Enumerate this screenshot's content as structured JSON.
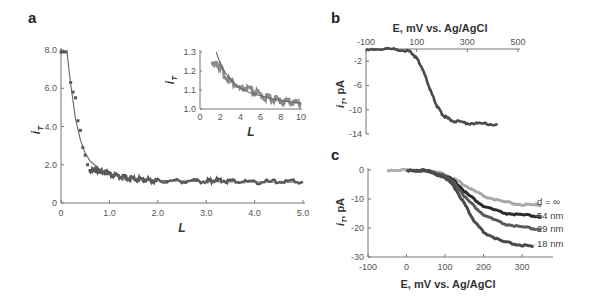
{
  "panels": {
    "a": {
      "label": "a"
    },
    "b": {
      "label": "b"
    },
    "c": {
      "label": "c"
    }
  },
  "colors": {
    "axis": "#777777",
    "data_dark": "#555555",
    "fit": "#666666",
    "d_inf": "#a8a8a8",
    "nm54": "#2a2a2a",
    "nm29": "#5a5a5a",
    "nm18": "#4a4a4a"
  },
  "chart_data": [
    {
      "panel": "a",
      "type": "scatter",
      "title": "",
      "xlabel": "L",
      "ylabel": "i_T",
      "xlim": [
        0,
        5.0
      ],
      "ylim": [
        0,
        8.0
      ],
      "xticks": [
        "0",
        "1.0",
        "2.0",
        "3.0",
        "4.0",
        "5.0"
      ],
      "yticks": [
        "0",
        "2.0",
        "4.0",
        "6.0",
        "8.0"
      ],
      "series": [
        {
          "name": "data",
          "x": [
            0.0,
            0.05,
            0.1,
            0.2,
            0.25,
            0.3,
            0.35,
            0.4,
            0.45,
            0.5,
            0.55,
            0.6,
            0.7,
            0.8,
            0.9,
            1.0,
            1.2,
            1.4,
            1.6,
            1.8,
            2.0,
            2.5,
            3.0,
            3.2,
            3.5,
            4.0,
            4.5,
            5.0
          ],
          "y": [
            7.9,
            7.9,
            7.9,
            6.3,
            5.8,
            5.5,
            4.3,
            3.8,
            2.9,
            2.5,
            2.0,
            1.7,
            1.75,
            1.7,
            1.6,
            1.5,
            1.4,
            1.3,
            1.25,
            1.2,
            1.15,
            1.15,
            1.15,
            1.2,
            1.15,
            1.1,
            1.12,
            1.12
          ]
        },
        {
          "name": "fit",
          "x": [
            0.12,
            0.15,
            0.2,
            0.3,
            0.4,
            0.5,
            0.6,
            0.8,
            1.0,
            1.3,
            1.6,
            2.0,
            3.0,
            4.0,
            5.0
          ],
          "y": [
            8.0,
            7.3,
            6.2,
            4.4,
            3.3,
            2.6,
            2.2,
            1.75,
            1.5,
            1.33,
            1.25,
            1.18,
            1.12,
            1.1,
            1.09
          ]
        }
      ],
      "inset": {
        "type": "scatter",
        "xlabel": "L",
        "ylabel": "i_T",
        "xlim": [
          0,
          10
        ],
        "ylim": [
          1.0,
          1.3
        ],
        "xticks": [
          "0",
          "2",
          "4",
          "6",
          "8",
          "10"
        ],
        "yticks": [
          "1.0",
          "1.1",
          "1.2",
          "1.3"
        ],
        "series": [
          {
            "name": "data",
            "x": [
              1.2,
              1.5,
              1.8,
              2.0,
              2.5,
              3.0,
              3.5,
              4.0,
              4.5,
              5.0,
              5.5,
              6.0,
              6.5,
              7.0,
              7.5,
              8.0,
              8.5,
              9.0,
              9.5,
              10.0
            ],
            "y": [
              1.25,
              1.24,
              1.23,
              1.22,
              1.17,
              1.15,
              1.13,
              1.1,
              1.11,
              1.1,
              1.09,
              1.07,
              1.06,
              1.055,
              1.05,
              1.045,
              1.04,
              1.04,
              1.035,
              1.03
            ]
          },
          {
            "name": "fit",
            "x": [
              1.6,
              2.0,
              2.5,
              3.0,
              3.5,
              4.0,
              5.0,
              6.0,
              7.0,
              8.0,
              9.0,
              10.0
            ],
            "y": [
              1.3,
              1.24,
              1.19,
              1.155,
              1.13,
              1.11,
              1.085,
              1.07,
              1.055,
              1.045,
              1.037,
              1.03
            ]
          }
        ]
      }
    },
    {
      "panel": "b",
      "type": "line",
      "xlabel": "E, mV vs. Ag/AgCl",
      "ylabel": "i_T, pA",
      "xlim": [
        -100,
        500
      ],
      "ylim": [
        -14,
        0
      ],
      "xticks": [
        "-100",
        "100",
        "300",
        "500"
      ],
      "yticks": [
        "-2",
        "-6",
        "-10",
        "-14"
      ],
      "series": [
        {
          "name": "tip current",
          "x": [
            -100,
            0,
            50,
            80,
            100,
            120,
            140,
            160,
            180,
            200,
            220,
            250,
            300,
            350,
            420
          ],
          "y": [
            0,
            0,
            -0.2,
            -0.6,
            -1.5,
            -3.0,
            -5.2,
            -7.5,
            -9.4,
            -10.7,
            -11.4,
            -11.9,
            -12.2,
            -12.3,
            -12.4
          ]
        }
      ]
    },
    {
      "panel": "c",
      "type": "line",
      "xlabel": "E, mV vs. Ag/AgCl",
      "ylabel": "i_T, pA",
      "xlim": [
        -100,
        350
      ],
      "ylim": [
        -30,
        0
      ],
      "xticks": [
        "-100",
        "0",
        "100",
        "200",
        "300"
      ],
      "yticks": [
        "0",
        "-10",
        "-20",
        "-30"
      ],
      "series": [
        {
          "name": "d = ∞",
          "x": [
            -50,
            0,
            50,
            100,
            130,
            160,
            200,
            250,
            300,
            350
          ],
          "y": [
            0,
            0,
            -0.3,
            -1.5,
            -3.5,
            -6.0,
            -9.0,
            -11.0,
            -12.0,
            -12.3
          ]
        },
        {
          "name": "54 nm",
          "x": [
            20,
            50,
            100,
            130,
            160,
            200,
            250,
            300,
            350
          ],
          "y": [
            0,
            -0.2,
            -1.8,
            -4.5,
            -8.5,
            -12.5,
            -14.8,
            -15.6,
            -16.0
          ]
        },
        {
          "name": "29 nm",
          "x": [
            0,
            50,
            100,
            130,
            160,
            200,
            250,
            300,
            350
          ],
          "y": [
            0,
            -0.2,
            -2.0,
            -5.5,
            -10.5,
            -15.5,
            -18.5,
            -19.8,
            -20.5
          ]
        },
        {
          "name": "18 nm",
          "x": [
            0,
            50,
            100,
            125,
            150,
            175,
            200,
            250,
            300,
            330
          ],
          "y": [
            0,
            -0.3,
            -2.5,
            -6.0,
            -11.5,
            -17.5,
            -21.5,
            -24.8,
            -26.0,
            -26.5
          ]
        }
      ],
      "curve_labels": [
        "d = ∞",
        "54 nm",
        "29 nm",
        "18 nm"
      ]
    }
  ]
}
